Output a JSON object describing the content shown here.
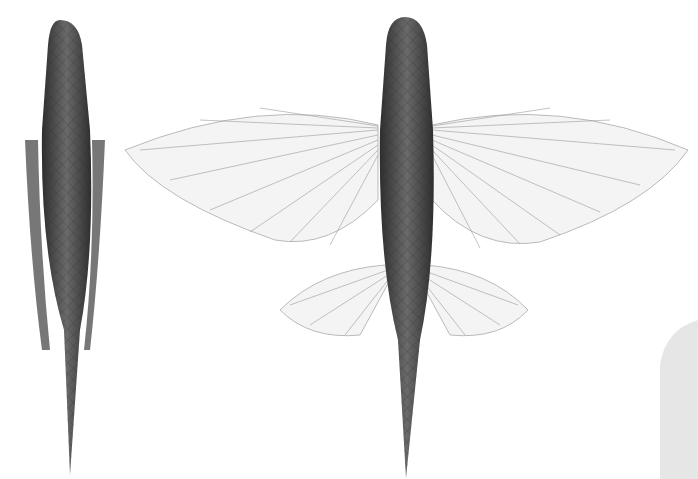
{
  "image": {
    "description": "Scientific illustration of flying fish: dorsal view with fins folded (left) and dorsal view with pectoral and pelvic fins spread (center)",
    "background": "#ffffff",
    "fish_body_color": "#4a4a4a",
    "fin_color": "#f2f2f2",
    "fin_ray_color": "#9a9a9a",
    "corner_panel_color": "#e6e6e6"
  },
  "figures": [
    {
      "label": "folded-fish",
      "pose": "fins folded"
    },
    {
      "label": "spread-fish",
      "pose": "fins spread"
    }
  ]
}
